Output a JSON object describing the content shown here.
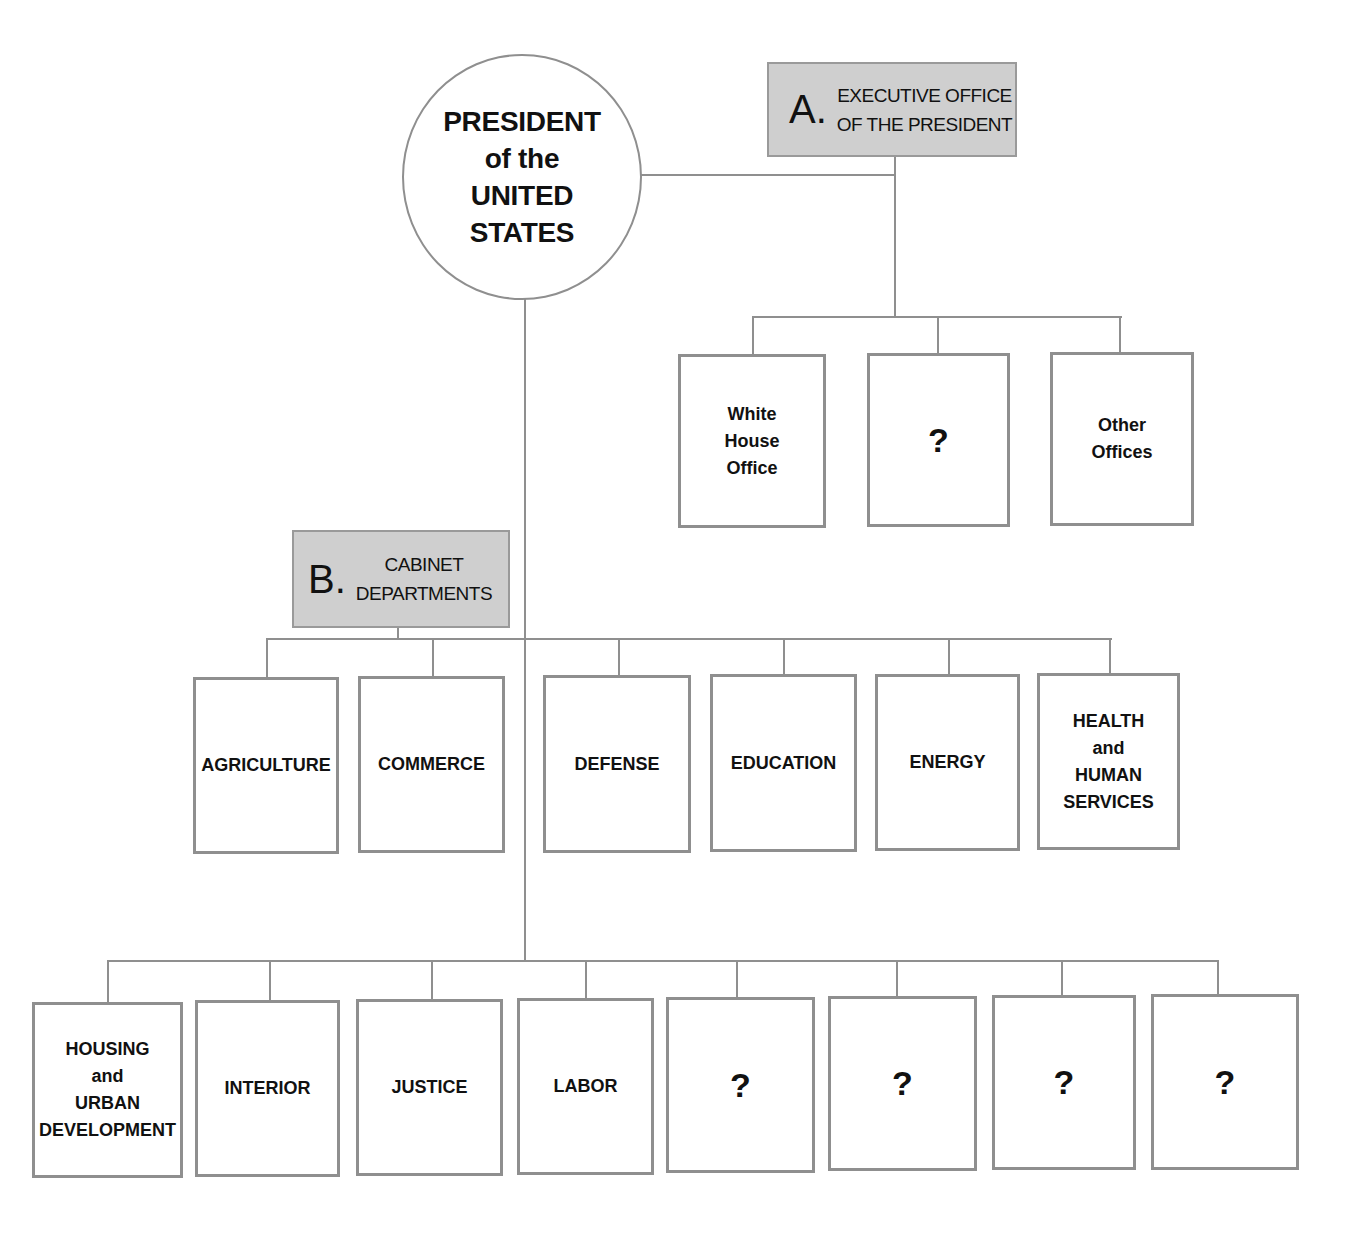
{
  "chart": {
    "root": {
      "label": "PRESIDENT\nof the\nUNITED\nSTATES"
    },
    "sections": [
      {
        "letter": "A.",
        "title": "EXECUTIVE OFFICE\nOF THE PRESIDENT",
        "children": [
          {
            "label": "White\nHouse\nOffice"
          },
          {
            "label": "?"
          },
          {
            "label": "Other\nOffices"
          }
        ]
      },
      {
        "letter": "B.",
        "title": "CABINET\nDEPARTMENTS",
        "row1": [
          {
            "label": "AGRICULTURE"
          },
          {
            "label": "COMMERCE"
          },
          {
            "label": "DEFENSE"
          },
          {
            "label": "EDUCATION"
          },
          {
            "label": "ENERGY"
          },
          {
            "label": "HEALTH\nand\nHUMAN\nSERVICES"
          }
        ],
        "row2": [
          {
            "label": "HOUSING\nand\nURBAN\nDEVELOPMENT"
          },
          {
            "label": "INTERIOR"
          },
          {
            "label": "JUSTICE"
          },
          {
            "label": "LABOR"
          },
          {
            "label": "?"
          },
          {
            "label": "?"
          },
          {
            "label": "?"
          },
          {
            "label": "?"
          }
        ]
      }
    ]
  },
  "colors": {
    "line": "#8f8f8f",
    "label_fill": "#cfcfcf",
    "text": "#111111"
  }
}
